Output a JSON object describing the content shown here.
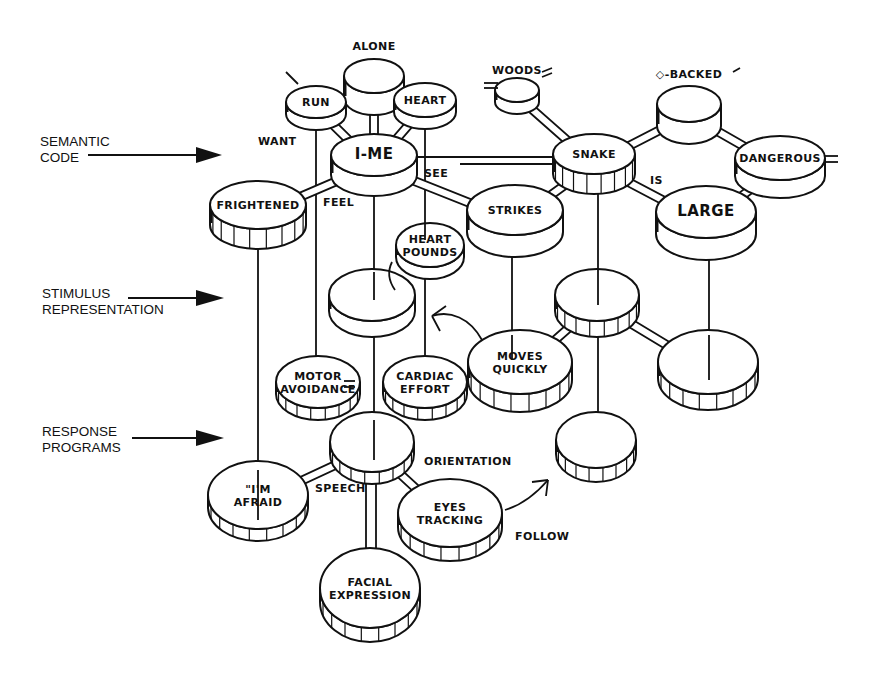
{
  "figure": {
    "levels": [
      {
        "id": "semantic",
        "lines": [
          "SEMANTIC",
          "CODE"
        ]
      },
      {
        "id": "stimulus",
        "lines": [
          "STIMULUS",
          "REPRESENTATION"
        ]
      },
      {
        "id": "response",
        "lines": [
          "RESPONSE",
          "PROGRAMS"
        ]
      }
    ],
    "nodes": [
      {
        "id": "alone",
        "lines": [],
        "caption": "ALONE",
        "level": "semantic"
      },
      {
        "id": "run",
        "lines": [
          "RUN"
        ],
        "level": "semantic"
      },
      {
        "id": "heart",
        "lines": [
          "HEART"
        ],
        "level": "semantic"
      },
      {
        "id": "i-me",
        "lines": [
          "I-ME"
        ],
        "level": "semantic"
      },
      {
        "id": "frightened",
        "lines": [
          "FRIGHTENED"
        ],
        "level": "semantic"
      },
      {
        "id": "woods",
        "lines": [],
        "caption": "WOODS",
        "level": "semantic"
      },
      {
        "id": "backed",
        "lines": [],
        "caption": "◇-BACKED",
        "level": "semantic"
      },
      {
        "id": "snake",
        "lines": [
          "SNAKE"
        ],
        "level": "semantic"
      },
      {
        "id": "dangerous",
        "lines": [
          "DANGEROUS"
        ],
        "level": "semantic"
      },
      {
        "id": "strikes",
        "lines": [
          "STRIKES"
        ],
        "level": "semantic"
      },
      {
        "id": "large",
        "lines": [
          "LARGE"
        ],
        "level": "semantic"
      },
      {
        "id": "heart-pounds",
        "lines": [
          "HEART",
          "POUNDS"
        ],
        "level": "stimulus"
      },
      {
        "id": "stim-self",
        "lines": [],
        "level": "stimulus"
      },
      {
        "id": "stim-snake",
        "lines": [],
        "level": "stimulus"
      },
      {
        "id": "moves-quickly",
        "lines": [
          "MOVES",
          "QUICKLY"
        ],
        "level": "stimulus"
      },
      {
        "id": "stim-large",
        "lines": [],
        "level": "stimulus"
      },
      {
        "id": "motor-avoidance",
        "lines": [
          "MOTOR",
          "AVOIDANCE"
        ],
        "level": "response"
      },
      {
        "id": "cardiac-effort",
        "lines": [
          "CARDIAC",
          "EFFORT"
        ],
        "level": "response"
      },
      {
        "id": "resp-center",
        "lines": [],
        "level": "response"
      },
      {
        "id": "resp-snake",
        "lines": [],
        "level": "response"
      },
      {
        "id": "im-afraid",
        "lines": [
          "\"I'M",
          "AFRAID"
        ],
        "level": "response"
      },
      {
        "id": "eyes-tracking",
        "lines": [
          "EYES",
          "TRACKING"
        ],
        "level": "response"
      },
      {
        "id": "facial-expression",
        "lines": [
          "FACIAL",
          "EXPRESSION"
        ],
        "level": "response"
      }
    ],
    "edge_labels": {
      "want": "WANT",
      "feel": "FEEL",
      "see": "SEE",
      "is": "IS",
      "speech": "SPEECH",
      "orientation": "ORIENTATION",
      "follow": "FOLLOW"
    }
  }
}
